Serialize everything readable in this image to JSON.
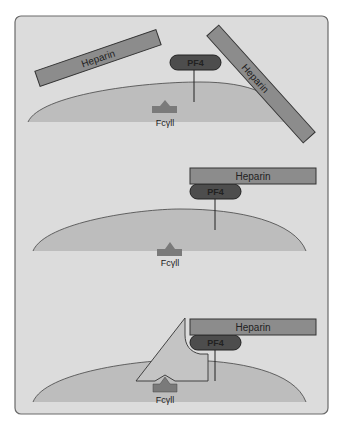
{
  "colors": {
    "panel_bg": "#dcdcdc",
    "panel_border": "#6a6a6a",
    "cell_fill": "#bdbdbd",
    "cell_edge": "#444444",
    "heparin_fill": "#8c8c8c",
    "pf4_fill": "#4d4d4d",
    "receptor_fill": "#7a7a7a",
    "antibody_fill": "#c4c4c4"
  },
  "panels": [
    {
      "id": "unbound",
      "heparin_labels": [
        "Heparin",
        "Heparin"
      ],
      "pf4_label": "PF4",
      "receptor_label": "Fcγll"
    },
    {
      "id": "complex",
      "heparin_labels": [
        "Heparin"
      ],
      "pf4_label": "PF4",
      "receptor_label": "Fcγll"
    },
    {
      "id": "antibody-bound",
      "heparin_labels": [
        "Heparin"
      ],
      "pf4_label": "PF4",
      "receptor_label": "Fcγll"
    }
  ]
}
